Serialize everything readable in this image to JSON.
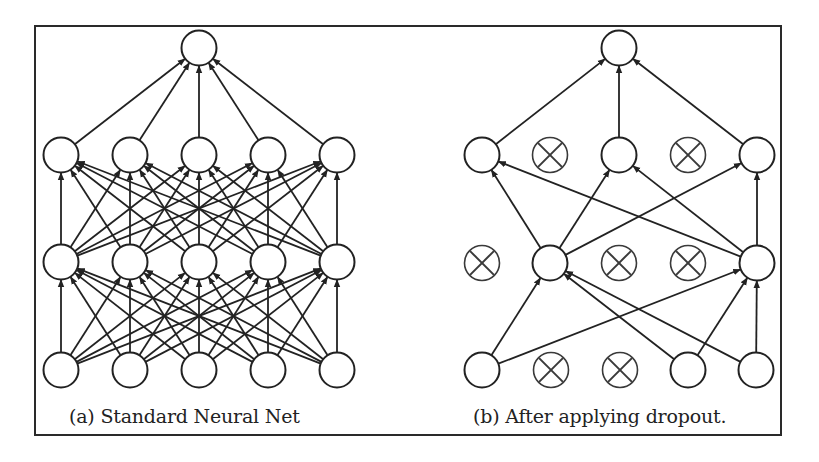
{
  "figure": {
    "border_color": "#2a2a2a",
    "stroke_color": "#222222",
    "dropped_stroke_color": "#3a3a3a",
    "node_radius": 17.5
  },
  "panels": [
    {
      "id": "a",
      "caption": "(a) Standard Neural Net",
      "layers": [
        {
          "name": "output",
          "y": 48,
          "nodes": [
            {
              "x": 199,
              "dropped": false
            }
          ]
        },
        {
          "name": "hidden-1",
          "y": 155,
          "nodes": [
            {
              "x": 61,
              "dropped": false
            },
            {
              "x": 130,
              "dropped": false
            },
            {
              "x": 199,
              "dropped": false
            },
            {
              "x": 268,
              "dropped": false
            },
            {
              "x": 337,
              "dropped": false
            }
          ]
        },
        {
          "name": "hidden-2",
          "y": 262,
          "nodes": [
            {
              "x": 61,
              "dropped": false
            },
            {
              "x": 130,
              "dropped": false
            },
            {
              "x": 199,
              "dropped": false
            },
            {
              "x": 268,
              "dropped": false
            },
            {
              "x": 337,
              "dropped": false
            }
          ]
        },
        {
          "name": "input",
          "y": 370,
          "nodes": [
            {
              "x": 61,
              "dropped": false
            },
            {
              "x": 130,
              "dropped": false
            },
            {
              "x": 199,
              "dropped": false
            },
            {
              "x": 268,
              "dropped": false
            },
            {
              "x": 337,
              "dropped": false
            }
          ]
        }
      ],
      "connectivity": "full"
    },
    {
      "id": "b",
      "caption": "(b) After applying dropout.",
      "layers": [
        {
          "name": "output",
          "y": 48,
          "nodes": [
            {
              "x": 619,
              "dropped": false
            }
          ]
        },
        {
          "name": "hidden-1",
          "y": 155,
          "nodes": [
            {
              "x": 482,
              "dropped": false
            },
            {
              "x": 550,
              "dropped": true
            },
            {
              "x": 619,
              "dropped": false
            },
            {
              "x": 688,
              "dropped": true
            },
            {
              "x": 757,
              "dropped": false
            }
          ]
        },
        {
          "name": "hidden-2",
          "y": 263,
          "nodes": [
            {
              "x": 482,
              "dropped": true
            },
            {
              "x": 550,
              "dropped": false
            },
            {
              "x": 619,
              "dropped": true
            },
            {
              "x": 688,
              "dropped": true
            },
            {
              "x": 757,
              "dropped": false
            }
          ]
        },
        {
          "name": "input",
          "y": 370,
          "nodes": [
            {
              "x": 482,
              "dropped": false
            },
            {
              "x": 551,
              "dropped": true
            },
            {
              "x": 620,
              "dropped": true
            },
            {
              "x": 688,
              "dropped": false
            },
            {
              "x": 756,
              "dropped": false
            }
          ]
        }
      ],
      "connectivity": "kept-only"
    }
  ]
}
